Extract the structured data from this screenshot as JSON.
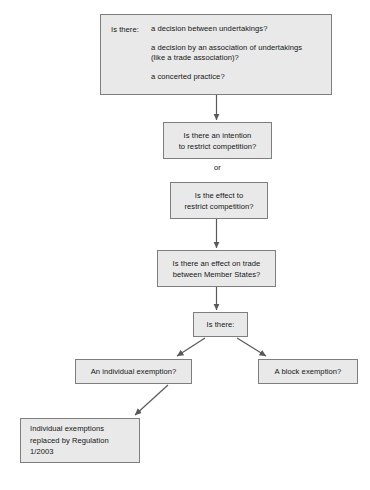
{
  "diagram": {
    "background_color": "#ffffff",
    "node_fill": "#e9e9e9",
    "node_border": "#7e7e7e",
    "connector_color": "#595959",
    "nodes": {
      "agreement": {
        "label": "Is there:",
        "items": [
          "a decision between undertakings?",
          "a decision by an association of undertakings\n(like a trade association)?",
          "a concerted practice?"
        ]
      },
      "intention": {
        "line1": "Is there an intention",
        "line2": "to restrict competition?"
      },
      "or_connector": "or",
      "effect": {
        "line1": "Is the effect to",
        "line2": "restrict competition?"
      },
      "trade": {
        "line1": "Is there an effect on trade",
        "line2": "between Member States?"
      },
      "isthere": {
        "line1": "Is there:"
      },
      "individual_exemption": {
        "line1": "An individual exemption?"
      },
      "block_exemption": {
        "line1": "A block exemption?"
      },
      "regulation": {
        "line1": "Individual exemptions",
        "line2": "replaced by Regulation",
        "line3": "1/2003"
      }
    }
  }
}
